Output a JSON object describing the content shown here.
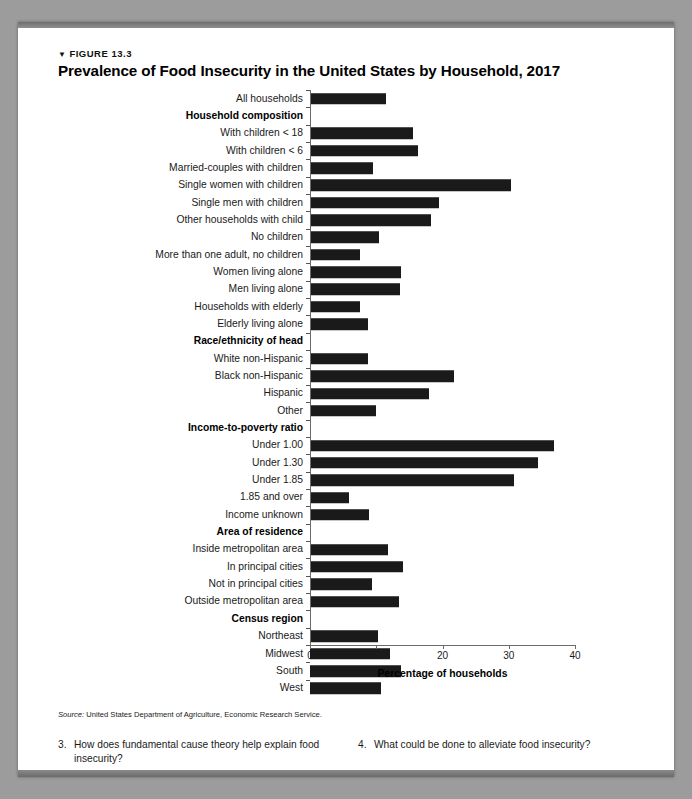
{
  "figure": {
    "kicker_triangle": "▼",
    "kicker": "FIGURE 13.3",
    "title": "Prevalence of Food Insecurity in the United States by Household, 2017",
    "source_prefix": "Source:",
    "source_text": " United States Department of Agriculture, Economic Research Service."
  },
  "chart_data": {
    "type": "bar",
    "orientation": "horizontal",
    "title": "Prevalence of Food Insecurity in the United States by Household, 2017",
    "xlabel": "Percentage of households",
    "ylabel": "",
    "xlim": [
      0,
      40
    ],
    "xticks": [
      0,
      10,
      20,
      30,
      40
    ],
    "grid": false,
    "legend": null,
    "bar_color": "#1a1a1a",
    "categories": [
      "All households",
      "Household composition",
      "With children < 18",
      "With children < 6",
      "Married-couples with children",
      "Single women with children",
      "Single men with children",
      "Other households with child",
      "No children",
      "More than one adult, no children",
      "Women living alone",
      "Men living alone",
      "Households with elderly",
      "Elderly living alone",
      "Race/ethnicity of head",
      "White non-Hispanic",
      "Black non-Hispanic",
      "Hispanic",
      "Other",
      "Income-to-poverty ratio",
      "Under 1.00",
      "Under 1.30",
      "Under 1.85",
      "1.85 and over",
      "Income unknown",
      "Area of residence",
      "Inside metropolitan area",
      "In principal cities",
      "Not in principal cities",
      "Outside metropolitan area",
      "Census region",
      "Northeast",
      "Midwest",
      "South",
      "West"
    ],
    "group_headers": [
      "Household composition",
      "Race/ethnicity of head",
      "Income-to-poverty ratio",
      "Area of residence",
      "Census region"
    ],
    "values": [
      11.5,
      null,
      15.6,
      16.3,
      9.5,
      30.3,
      19.5,
      18.2,
      10.4,
      7.5,
      13.8,
      13.6,
      7.6,
      8.8,
      null,
      8.8,
      21.8,
      18.0,
      10.0,
      null,
      36.8,
      34.4,
      30.8,
      5.9,
      8.9,
      null,
      11.8,
      14.1,
      9.4,
      13.4,
      null,
      10.2,
      12.1,
      13.8,
      10.7
    ]
  },
  "questions": [
    {
      "num": "3.",
      "text": "How does fundamental cause theory help explain food insecurity?"
    },
    {
      "num": "4.",
      "text": "What could be done to alleviate food insecurity?"
    }
  ]
}
